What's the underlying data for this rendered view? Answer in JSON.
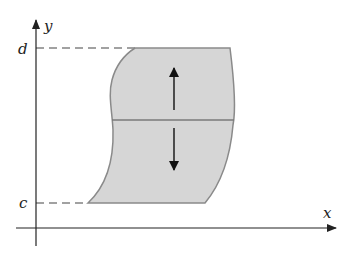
{
  "diagram": {
    "labels": {
      "x_axis": "x",
      "y_axis": "y",
      "top_bound": "d",
      "bottom_bound": "c"
    },
    "colors": {
      "region_fill": "#d6d6d6",
      "region_stroke": "#8a8a8a",
      "axis": "#222222",
      "dashed": "#444444",
      "arrow": "#111111"
    },
    "arrows": [
      {
        "direction": "up"
      },
      {
        "direction": "down"
      }
    ]
  }
}
